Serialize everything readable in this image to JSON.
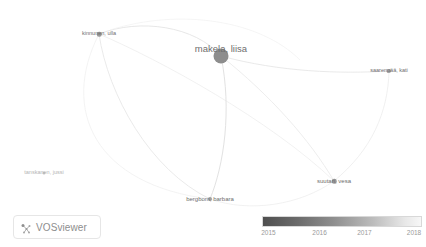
{
  "app": {
    "name": "VOSviewer",
    "visualization_type": "author co-authorship overlay network"
  },
  "logo": {
    "text": "VOSviewer",
    "icon": "vosviewer-network-icon"
  },
  "legend": {
    "type": "score-gradient",
    "gradient_from_color": "#4f4f4f",
    "gradient_to_color": "#f7f7f7",
    "ticks": [
      {
        "label": "2015",
        "position_pct": 4
      },
      {
        "label": "2016",
        "position_pct": 36
      },
      {
        "label": "2017",
        "position_pct": 64
      },
      {
        "label": "2018",
        "position_pct": 95
      }
    ]
  },
  "network": {
    "node_color": "#8d8d8d",
    "label_color": "#6e6e6e",
    "edge_color": "#e9e9e9",
    "nodes": [
      {
        "id": "makela-liisa",
        "label": "makela, liisa",
        "x": 221,
        "y": 56,
        "size": 15,
        "font_size": 9.5,
        "color": "#8d8d8d",
        "label_dx": 0,
        "label_dy": -9
      },
      {
        "id": "kinnunen-ulla",
        "label": "kinnunen, ulla",
        "x": 99,
        "y": 34,
        "size": 4.5,
        "font_size": 5.5,
        "color": "#9a9a9a",
        "label_dx": 0,
        "label_dy": 0
      },
      {
        "id": "saarenpaa-kati",
        "label": "saarenpää, kati",
        "x": 389,
        "y": 71,
        "size": 4,
        "font_size": 5.5,
        "color": "#9f9f9f",
        "label_dx": 0,
        "label_dy": 0
      },
      {
        "id": "suutari-vesa",
        "label": "suutari, vesa",
        "x": 334,
        "y": 181,
        "size": 4.5,
        "font_size": 6,
        "color": "#9a9a9a",
        "label_dx": 0,
        "label_dy": 0
      },
      {
        "id": "bergbom-barbara",
        "label": "bergbom, barbara",
        "x": 210,
        "y": 199,
        "size": 4,
        "font_size": 6,
        "color": "#a0a0a0",
        "label_dx": 0,
        "label_dy": 0
      },
      {
        "id": "tanskanen-jussi",
        "label": "tanskanen, jussi",
        "x": 44,
        "y": 173,
        "size": 3,
        "font_size": 5.5,
        "color": "#c4c4c4",
        "label_dx": 0,
        "label_dy": 0
      }
    ],
    "edges": [
      {
        "from": "kinnunen-ulla",
        "to": "makela-liisa"
      },
      {
        "from": "kinnunen-ulla",
        "to": "bergbom-barbara"
      },
      {
        "from": "kinnunen-ulla",
        "to": "suutari-vesa"
      },
      {
        "from": "makela-liisa",
        "to": "saarenpaa-kati"
      },
      {
        "from": "makela-liisa",
        "to": "suutari-vesa"
      },
      {
        "from": "makela-liisa",
        "to": "bergbom-barbara"
      },
      {
        "from": "bergbom-barbara",
        "to": "suutari-vesa"
      },
      {
        "from": "suutari-vesa",
        "to": "saarenpaa-kati"
      }
    ]
  }
}
